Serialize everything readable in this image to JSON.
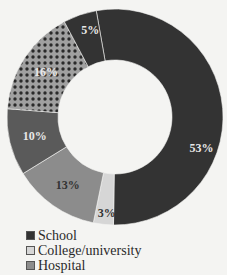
{
  "chart_data": {
    "type": "pie",
    "donut": true,
    "title": "",
    "segments": [
      {
        "label": "School",
        "value": 53,
        "display": "53%",
        "color": "#333333",
        "label_color": "#e8e8e8",
        "pattern": "solid"
      },
      {
        "label": "College/university",
        "value": 3,
        "display": "3%",
        "color": "#d6d6d6",
        "label_color": "#333333",
        "pattern": "solid"
      },
      {
        "label": "Hospital",
        "value": 13,
        "display": "13%",
        "color": "#8c8c8c",
        "label_color": "#333333",
        "pattern": "solid"
      },
      {
        "label": "",
        "value": 10,
        "display": "10%",
        "color": "#5a5a5a",
        "label_color": "#e8e8e8",
        "pattern": "solid"
      },
      {
        "label": "",
        "value": 16,
        "display": "16%",
        "color": "#9a9a9a",
        "label_color": "#e8e8e8",
        "pattern": "dots"
      },
      {
        "label": "",
        "value": 5,
        "display": "5%",
        "color": "#333333",
        "label_color": "#e8e8e8",
        "pattern": "solid"
      }
    ],
    "start_angle_deg": -10,
    "direction": "clockwise",
    "legend_position": "bottom-left",
    "legend_visible_entries": [
      "School",
      "College/university",
      "Hospital"
    ]
  },
  "legend": {
    "items": [
      {
        "label": "School",
        "color": "#333333"
      },
      {
        "label": "College/university",
        "color": "#d6d6d6"
      },
      {
        "label": "Hospital",
        "color": "#8c8c8c"
      }
    ]
  }
}
